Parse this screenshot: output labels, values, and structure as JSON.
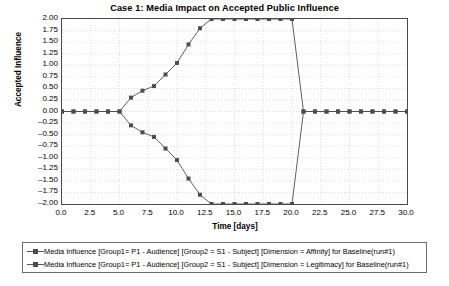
{
  "chart_data": {
    "type": "line",
    "title": "Case 1: Media Impact on Accepted Public Influence",
    "xlabel": "Time [days]",
    "ylabel": "Accepted Influence",
    "xlim": [
      0.0,
      30.0
    ],
    "ylim": [
      -2.0,
      2.0
    ],
    "xticks": [
      "0.0",
      "2.5",
      "5.0",
      "7.5",
      "10.0",
      "12.5",
      "15.0",
      "17.5",
      "20.0",
      "22.5",
      "25.0",
      "27.5",
      "30.0"
    ],
    "yticks": [
      "2.00",
      "1.75",
      "1.50",
      "1.25",
      "1.00",
      "0.75",
      "0.50",
      "0.25",
      "0.00",
      "-0.25",
      "-0.50",
      "-0.75",
      "-1.00",
      "-1.25",
      "-1.50",
      "-1.75",
      "-2.00"
    ],
    "grid": true,
    "legend_position": "below",
    "marker": "square",
    "series": [
      {
        "name": "Media Influence [Group1= P1 - Audience] [Group2 = S1 - Subject] [Dimension = Affinity] for Baseline(run#1)",
        "color": "#4d4d4d",
        "x": [
          0,
          1,
          2,
          3,
          4,
          5,
          6,
          7,
          8,
          9,
          10,
          11,
          12,
          13,
          14,
          15,
          16,
          17,
          18,
          19,
          20,
          21,
          22,
          23,
          24,
          25,
          26,
          27,
          28,
          29,
          30
        ],
        "y": [
          0.0,
          0.0,
          0.0,
          0.0,
          0.0,
          0.0,
          0.3,
          0.45,
          0.55,
          0.8,
          1.05,
          1.45,
          1.8,
          2.0,
          2.0,
          2.0,
          2.0,
          2.0,
          2.0,
          2.0,
          2.0,
          0.0,
          0.0,
          0.0,
          0.0,
          0.0,
          0.0,
          0.0,
          0.0,
          0.0,
          0.0
        ]
      },
      {
        "name": "Media Influence [Group1= P1 - Audience] [Group2 = S1 - Subject] [Dimension = Legitimacy] for Baseline(run#1)",
        "color": "#4d4d4d",
        "x": [
          0,
          1,
          2,
          3,
          4,
          5,
          6,
          7,
          8,
          9,
          10,
          11,
          12,
          13,
          14,
          15,
          16,
          17,
          18,
          19,
          20,
          21,
          22,
          23,
          24,
          25,
          26,
          27,
          28,
          29,
          30
        ],
        "y": [
          0.0,
          0.0,
          0.0,
          0.0,
          0.0,
          0.0,
          -0.3,
          -0.45,
          -0.55,
          -0.8,
          -1.05,
          -1.45,
          -1.8,
          -2.0,
          -2.0,
          -2.0,
          -2.0,
          -2.0,
          -2.0,
          -2.0,
          -2.0,
          0.0,
          0.0,
          0.0,
          0.0,
          0.0,
          0.0,
          0.0,
          0.0,
          0.0,
          0.0
        ]
      }
    ]
  },
  "legend": {
    "entries": [
      "Media Influence [Group1= P1 - Audience] [Group2 = S1 - Subject] [Dimension = Affinity] for Baseline(run#1)",
      "Media Influence [Group1= P1 - Audience] [Group2 = S1 - Subject] [Dimension = Legitimacy] for Baseline(run#1)"
    ]
  },
  "colors": {
    "line": "#555555",
    "marker": "#4d4d4d",
    "grid": "#cccccc",
    "axis": "#4a4a4a",
    "background": "#ffffff"
  }
}
